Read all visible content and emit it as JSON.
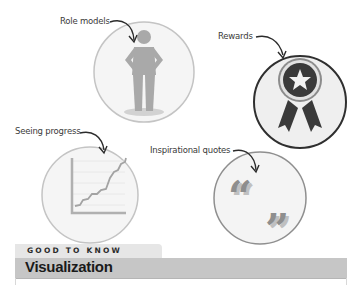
{
  "illustrations": [
    {
      "id": "role-models",
      "label": "Role models",
      "icon": "person-icon"
    },
    {
      "id": "rewards",
      "label": "Rewards",
      "icon": "award-ribbon-icon"
    },
    {
      "id": "seeing-progress",
      "label": "Seeing progress",
      "icon": "line-chart-icon"
    },
    {
      "id": "inspirational-quotes",
      "label": "Inspirational quotes",
      "icon": "quote-marks-icon"
    }
  ],
  "section": {
    "kicker": "GOOD TO KNOW",
    "title": "Visualization"
  },
  "colors": {
    "circle_light_border": "#bdbdbd",
    "circle_fill": "#f4f4f4",
    "rewards_border": "#333333",
    "figure_gray": "#a9a9a9",
    "award_dark": "#3a3a3a",
    "band_gray": "#c6c6c6",
    "tab_gray": "#e6e6e6"
  }
}
